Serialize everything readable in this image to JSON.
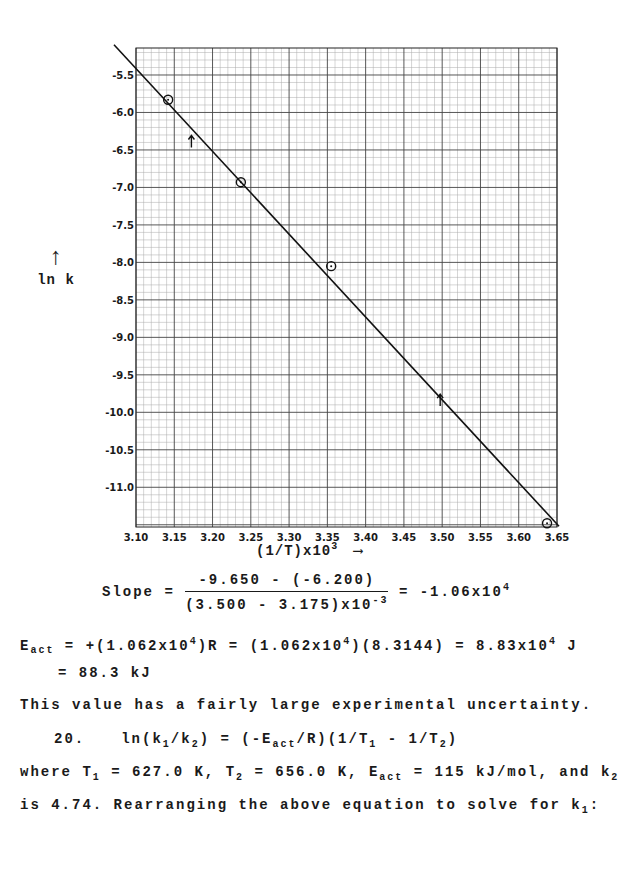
{
  "chart_data": {
    "type": "scatter",
    "title": "",
    "xlabel": "(1/T)x10^3",
    "ylabel": "ln k",
    "xlim": [
      3.1,
      3.65
    ],
    "ylim": [
      -11.53,
      -5.14
    ],
    "grid": true,
    "x_ticks": [
      "3.10",
      "3.15",
      "3.20",
      "3.25",
      "3.30",
      "3.35",
      "3.40",
      "3.45",
      "3.50",
      "3.55",
      "3.60",
      "3.65"
    ],
    "y_ticks": [
      "-5.5",
      "-6.0",
      "-6.5",
      "-7.0",
      "-7.5",
      "-8.0",
      "-8.5",
      "-9.0",
      "-9.5",
      "-10.0",
      "-10.5",
      "-11.0"
    ],
    "series": [
      {
        "name": "data points",
        "x": [
          3.142,
          3.237,
          3.355,
          3.637
        ],
        "y": [
          -5.83,
          -6.93,
          -8.05,
          -11.48
        ]
      },
      {
        "name": "best-fit line",
        "x": [
          3.1,
          3.65
        ],
        "y": [
          -5.43,
          -11.48
        ]
      }
    ],
    "annotations": [
      {
        "type": "arrow",
        "x": 3.175,
        "y": -6.2,
        "note": "slope point 1"
      },
      {
        "type": "arrow",
        "x": 3.5,
        "y": -9.65,
        "note": "slope point 2"
      }
    ]
  },
  "axes": {
    "x_title": "(1/T)x10",
    "x_title_sup": "3",
    "x_arrow": "⟶",
    "y_title": "ln k",
    "y_arrow": "↑"
  },
  "text": {
    "slope_label": "Slope =",
    "slope_num": "-9.650 - (-6.200)",
    "slope_den": "(3.500 - 3.175)x10",
    "slope_den_sup": "-3",
    "slope_result": "= -1.06x10",
    "slope_result_sup": "4",
    "eact_label": "E",
    "eact_sub": "act",
    "eact_eq1": " = +(1.062x10",
    "eact_sup1": "4",
    "eact_eq2": ")R = (1.062x10",
    "eact_sup2": "4",
    "eact_eq3": ")(8.3144) = 8.83x10",
    "eact_sup3": "4",
    "eact_eq4": " J",
    "eact_kj": "= 88.3 kJ",
    "uncertainty": "This value has a fairly large experimental uncertainty.",
    "problem_number": "20.",
    "eq_part1": "ln(k",
    "eq_sub1": "1",
    "eq_part2": "/k",
    "eq_sub2": "2",
    "eq_part3": ") = (-E",
    "eq_sub3": "act",
    "eq_part4": "/R)(1/T",
    "eq_sub4": "1",
    "eq_part5": " - 1/T",
    "eq_sub5": "2",
    "eq_part6": ")",
    "where_1": "where T",
    "where_sub1": "1",
    "where_2": " = 627.0 K, T",
    "where_sub2": "2",
    "where_3": " = 656.0 K, E",
    "where_sub3": "act",
    "where_4": " = 115 kJ/mol, and k",
    "where_sub4": "2",
    "rearr_1": "is 4.74. Rearranging the above equation to solve for k",
    "rearr_sub": "1",
    "rearr_2": ":"
  }
}
